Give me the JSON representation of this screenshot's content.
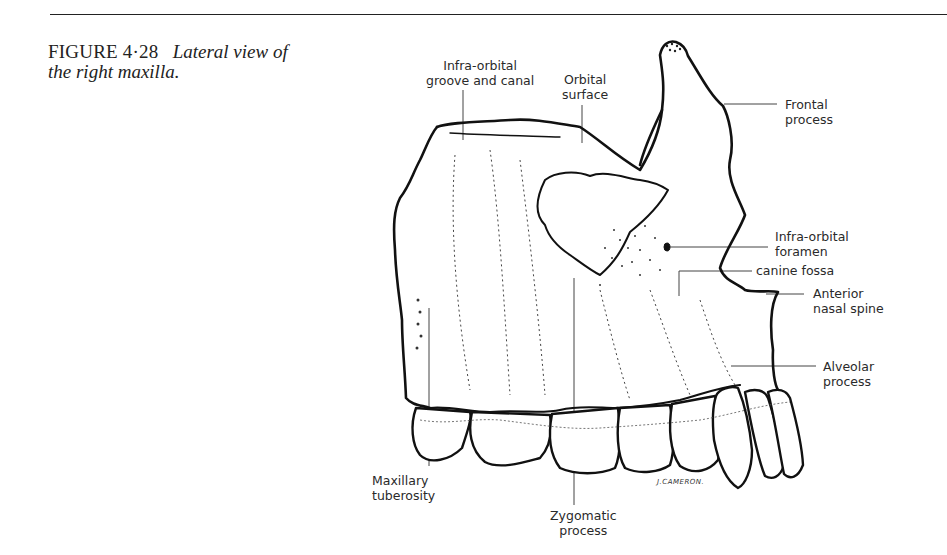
{
  "figure": {
    "number": "FIGURE 4·28",
    "caption_line1": "Lateral view of",
    "caption_line2": "the right maxilla."
  },
  "labels": {
    "infra_orbital_groove": "Infra-orbital\ngroove and canal",
    "orbital_surface": "Orbital\nsurface",
    "frontal_process": "Frontal\nprocess",
    "infra_orbital_foramen": "Infra-orbital\nforamen",
    "canine_fossa": "canine fossa",
    "anterior_nasal_spine": "Anterior\nnasal spine",
    "alveolar_process": "Alveolar\nprocess",
    "maxillary_tuberosity": "Maxillary\ntuberosity",
    "zygomatic_process": "Zygomatic\nprocess"
  },
  "artist_signature": "J.CAMERON."
}
